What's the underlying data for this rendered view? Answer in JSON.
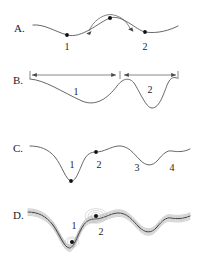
{
  "figure": {
    "background_color": "#ffffff",
    "curve_color": "#555555",
    "dot_color": "#111111",
    "arrow_color": "#6a6a6a",
    "ensemble_color": "#9a9a9a",
    "width": 218,
    "height": 267
  },
  "panels": [
    {
      "id": "A",
      "label": "A.",
      "label_x": 14,
      "label_y": 32,
      "description": "Double-well energy landscape with two minima and a barrier peak; curved arrows indicate transitions over the barrier",
      "curve": "M 33 25 C 44 24 54 31 67 35 C 82 39 99 22 110 18 C 122 14 136 30 145 32 C 158 34 170 30 178 26",
      "dots": [
        {
          "name": "minimum-1",
          "x": 67,
          "y": 35,
          "r": 1.9
        },
        {
          "name": "barrier-peak",
          "x": 110,
          "y": 18,
          "r": 2.0
        },
        {
          "name": "minimum-2",
          "x": 145,
          "y": 32,
          "r": 1.9
        }
      ],
      "curved_arrows": [
        {
          "name": "arrow-left-to-peak",
          "path": "M 88 30 C 92 19 102 14 110 14",
          "head_x": 88,
          "head_y": 31,
          "head_rot": 250
        },
        {
          "name": "arrow-peak-to-right",
          "path": "M 110 14 C 120 14 127 20 131 29",
          "head_x": 132,
          "head_y": 30,
          "head_rot": 292
        }
      ],
      "numbers": [
        {
          "text": "1",
          "x": 67,
          "y": 50
        },
        {
          "text": "2",
          "x": 145,
          "y": 50
        }
      ]
    },
    {
      "id": "B",
      "label": "B.",
      "label_x": 13,
      "label_y": 84,
      "description": "Landscape with one broad wide basin and one narrow deep basin; horizontal double-headed arrows measure the widths of each basin",
      "curve": "M 30 79 C 45 80 62 92 82 101 C 96 107 108 98 117 86 C 124 77 130 78 134 83 C 140 92 146 108 152 108 C 160 108 164 92 168 83 C 171 77 174 77 177 78",
      "dots": [],
      "span_arrows": [
        {
          "name": "width-arrow-basin-1",
          "x1": 30,
          "x2": 118,
          "y": 75
        },
        {
          "name": "width-arrow-basin-2",
          "x1": 122,
          "x2": 178,
          "y": 75
        }
      ],
      "ticks": [
        {
          "x": 30,
          "y1": 71,
          "y2": 79
        },
        {
          "x": 120,
          "y1": 71,
          "y2": 79
        },
        {
          "x": 178,
          "y1": 71,
          "y2": 79
        }
      ],
      "numbers": [
        {
          "text": "1",
          "x": 76,
          "y": 95
        },
        {
          "text": "2",
          "x": 150,
          "y": 93
        }
      ]
    },
    {
      "id": "C",
      "label": "C.",
      "label_x": 13,
      "label_y": 152,
      "description": "Rugged multi-minimum landscape with four labelled basins: a deep narrow well, a shallow well, and two broad shallow wells",
      "curve": "M 30 146 C 40 146 48 149 55 157 C 62 166 66 180 71 181 C 76 182 80 168 84 160 C 87 154 91 152 96 152 C 104 152 110 147 118 146 C 128 145 134 154 140 160 C 146 166 152 167 158 160 C 163 154 167 150 172 151 C 178 152 184 152 190 149",
      "dots": [
        {
          "name": "minimum-1-deep",
          "x": 71,
          "y": 181,
          "r": 1.9
        },
        {
          "name": "minimum-2-shallow",
          "x": 96,
          "y": 152,
          "r": 1.9
        }
      ],
      "numbers": [
        {
          "text": "1",
          "x": 72,
          "y": 168
        },
        {
          "text": "2",
          "x": 99,
          "y": 168
        },
        {
          "text": "3",
          "x": 137,
          "y": 171
        },
        {
          "text": "4",
          "x": 172,
          "y": 171
        }
      ]
    },
    {
      "id": "D",
      "label": "D.",
      "label_x": 13,
      "label_y": 219,
      "description": "Same rugged landscape rendered as an ensemble of fluctuating replica curves; dots for basins 1 and 2 are surrounded by concentric uncertainty halos",
      "curve": "M 28 212 C 38 212 46 216 53 225 C 60 235 64 247 69 248 C 74 249 78 233 83 226 C 86 221 90 219 95 219 C 103 219 109 214 117 213 C 127 212 133 221 139 227 C 145 233 151 234 157 227 C 162 221 166 217 171 218 C 177 219 183 219 190 216",
      "ensemble_offsets": [
        -3.2,
        -2.1,
        -1.1,
        1.1,
        2.2,
        3.4
      ],
      "dots": [
        {
          "name": "minimum-1-deep",
          "x": 72,
          "y": 242,
          "r": 2.0
        },
        {
          "name": "minimum-2-shallow",
          "x": 96,
          "y": 216,
          "r": 2.0
        }
      ],
      "halos": [
        {
          "cx": 72,
          "cy": 242,
          "rx": 4.5,
          "ry": 3.4
        },
        {
          "cx": 72,
          "cy": 242,
          "rx": 7.0,
          "ry": 5.0
        },
        {
          "cx": 96,
          "cy": 216,
          "rx": 5.0,
          "ry": 3.6
        },
        {
          "cx": 96,
          "cy": 216,
          "rx": 8.0,
          "ry": 5.6
        },
        {
          "cx": 96,
          "cy": 216,
          "rx": 11.0,
          "ry": 7.4
        }
      ],
      "numbers": [
        {
          "text": "1",
          "x": 74,
          "y": 229
        },
        {
          "text": "2",
          "x": 101,
          "y": 235
        }
      ]
    }
  ]
}
